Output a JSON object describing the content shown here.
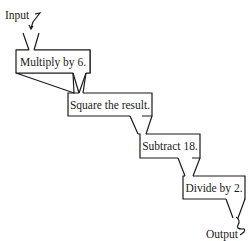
{
  "diagram": {
    "type": "function-machine-flowchart",
    "input_label": "Input",
    "output_label": "Output",
    "steps": [
      {
        "label": "Multiply by 6."
      },
      {
        "label": "Square the result."
      },
      {
        "label": "Subtract 18."
      },
      {
        "label": "Divide by 2."
      }
    ],
    "colors": {
      "stroke": "#1a1a1a",
      "background": "#ffffff"
    }
  }
}
